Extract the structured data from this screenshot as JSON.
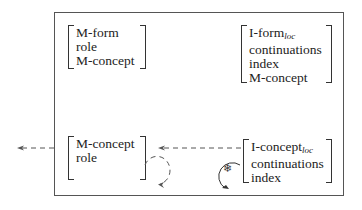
{
  "diagram": {
    "top_left_avm": {
      "lines": [
        "M-form",
        "role",
        "M-concept"
      ]
    },
    "top_right_avm": {
      "line0_main": "I-form",
      "line0_sub": "loc",
      "lines": [
        "continuations",
        "index",
        "M-concept"
      ]
    },
    "bottom_left_avm": {
      "lines": [
        "M-concept",
        "role"
      ]
    },
    "bottom_right_avm": {
      "line0_main": "I-concept",
      "line0_sub": "loc",
      "lines": [
        "continuations",
        "index"
      ]
    },
    "loop_symbol": "❄",
    "edges": [
      {
        "from": "bottom-right-avm",
        "to": "bottom-left-avm",
        "style": "dashed"
      },
      {
        "from": "outer-box",
        "to": "outside-left",
        "style": "dashed"
      },
      {
        "from": "bottom-left-avm",
        "to": "bottom-left-avm",
        "style": "dashed-loop"
      },
      {
        "from": "bottom-right-avm",
        "to": "bottom-right-avm",
        "style": "solid-loop",
        "label": "❄"
      }
    ],
    "colors": {
      "line": "#555555",
      "text": "#222222"
    }
  }
}
